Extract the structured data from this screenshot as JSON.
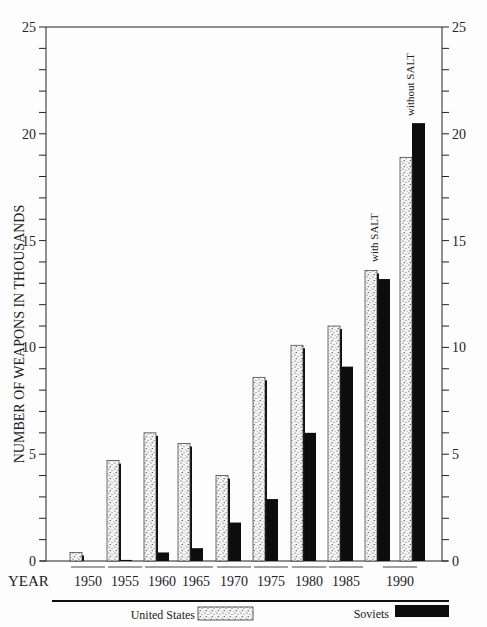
{
  "chart_data": {
    "type": "bar",
    "title": "",
    "ylabel": "NUMBER OF WEAPONS IN THOUSANDS",
    "xlabel": "YEAR",
    "ylim": [
      0,
      25
    ],
    "yticks_major": [
      0,
      5,
      10,
      15,
      20,
      25
    ],
    "yticks_minor_step": 1,
    "grid": false,
    "legend_position": "bottom",
    "categories": [
      "1950",
      "1955",
      "1960",
      "1965",
      "1970",
      "1975",
      "1980",
      "1985",
      "1990 (with SALT)",
      "1990 (without SALT)"
    ],
    "tick_labels": [
      "1950",
      "1955",
      "1960",
      "1965",
      "1970",
      "1975",
      "1980",
      "1985",
      "1990"
    ],
    "series": [
      {
        "name": "United States",
        "pattern": "stippled",
        "values": [
          0.4,
          4.7,
          6.0,
          5.5,
          4.0,
          8.6,
          10.1,
          11.0,
          13.6,
          18.9
        ]
      },
      {
        "name": "Soviets",
        "pattern": "solid-black",
        "values": [
          0.0,
          0.05,
          0.4,
          0.6,
          1.8,
          2.9,
          6.0,
          9.1,
          13.2,
          20.5
        ]
      }
    ],
    "annotations": [
      "with SALT",
      "without SALT"
    ]
  },
  "legend": {
    "us_label": "United States",
    "soviet_label": "Soviets"
  },
  "axis": {
    "year_label": "YEAR",
    "y_label": "NUMBER OF WEAPONS IN THOUSANDS"
  },
  "annotations": {
    "with_salt": "with SALT",
    "without_salt": "without SALT"
  },
  "colors": {
    "us_fill": "#f2f2f2",
    "us_speckle": "#333333",
    "soviet_fill": "#0d0d0d",
    "axis": "#222222"
  }
}
